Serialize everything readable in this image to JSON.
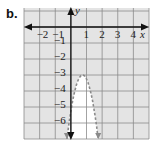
{
  "problem_label": "b.",
  "colors": {
    "shade": "#e4e4e4",
    "grid": "#8c8c8c",
    "axis": "#111111",
    "curve": "#8a8a8a",
    "unshaded": "#ffffff"
  },
  "chart_data": {
    "type": "line",
    "title": "",
    "xlabel": "x",
    "ylabel": "y",
    "xlim": [
      -3,
      5
    ],
    "ylim": [
      -7,
      1
    ],
    "grid": true,
    "x_tick_labels": [
      "-2",
      "-1",
      "1",
      "2",
      "3",
      "4"
    ],
    "y_tick_labels": [
      "-1",
      "-2",
      "-3",
      "-4",
      "-5",
      "-6"
    ],
    "series": [
      {
        "name": "boundary parabola",
        "style": "dashed",
        "vertex": [
          0.75,
          -3
        ],
        "equation_estimate": "y = -4(x - 0.75)^2 - 3",
        "x": [
          -0.25,
          0,
          0.25,
          0.5,
          0.75,
          1,
          1.25,
          1.5,
          1.75
        ],
        "y": [
          -7,
          -5.25,
          -4,
          -3.25,
          -3,
          -3.25,
          -4,
          -5.25,
          -7
        ]
      }
    ],
    "shading": "outside parabola (gray); inside parabola unshaded (white)"
  }
}
